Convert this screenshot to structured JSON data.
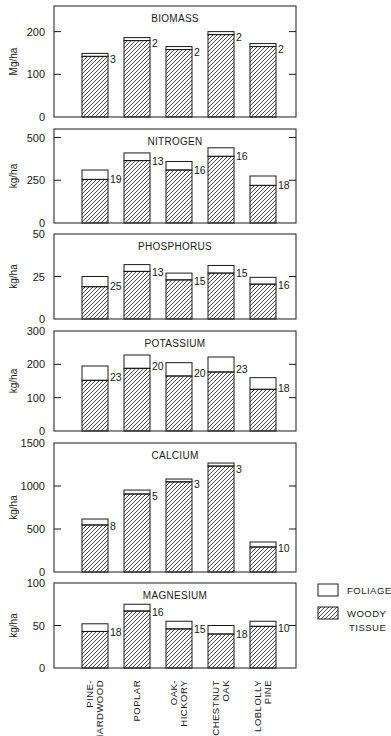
{
  "chart_data": {
    "type": "bar",
    "stacked": true,
    "categories": [
      "PINE-\nHARDWOOD",
      "POPLAR",
      "OAK-\nHICKORY",
      "CHESTNUT\nOAK",
      "LOBLOLLY\nPINE"
    ],
    "legend": {
      "placement": "right",
      "entries": [
        {
          "name": "FOLIAGE",
          "pattern": "open"
        },
        {
          "name": "WOODY\nTISSUE",
          "pattern": "hatched"
        }
      ]
    },
    "panels": [
      {
        "title": "BIOMASS",
        "ylabel": "Mg/ha",
        "ylim": [
          0,
          260
        ],
        "yticks": [
          0,
          100,
          200
        ],
        "grid": false,
        "series": [
          {
            "name": "WOODY TISSUE",
            "values": [
              142,
              179,
              158,
              193,
              165
            ]
          },
          {
            "name": "FOLIAGE",
            "values": [
              7,
              7,
              7,
              7,
              7
            ]
          }
        ],
        "totals": [
          149,
          186,
          165,
          200,
          172
        ],
        "annotations": [
          "3",
          "2",
          "2",
          "2",
          "2"
        ]
      },
      {
        "title": "NITROGEN",
        "ylabel": "kg/ha",
        "ylim": [
          0,
          550
        ],
        "yticks": [
          0,
          250,
          500
        ],
        "grid": false,
        "series": [
          {
            "name": "WOODY TISSUE",
            "values": [
              255,
              365,
              310,
              390,
              220
            ]
          },
          {
            "name": "FOLIAGE",
            "values": [
              55,
              45,
              50,
              50,
              55
            ]
          }
        ],
        "totals": [
          310,
          410,
          360,
          440,
          275
        ],
        "annotations": [
          "19",
          "13",
          "16",
          "16",
          "18"
        ]
      },
      {
        "title": "PHOSPHORUS",
        "ylabel": "kg/ha",
        "ylim": [
          0,
          50
        ],
        "yticks": [
          0,
          25,
          50
        ],
        "grid": false,
        "series": [
          {
            "name": "WOODY TISSUE",
            "values": [
              19,
              28,
              23,
              27,
              20.5
            ]
          },
          {
            "name": "FOLIAGE",
            "values": [
              6,
              4,
              4,
              4.5,
              4
            ]
          }
        ],
        "totals": [
          25,
          32,
          27,
          31.5,
          24.5
        ],
        "annotations": [
          "25",
          "13",
          "15",
          "15",
          "16"
        ]
      },
      {
        "title": "POTASSIUM",
        "ylabel": "kg/ha",
        "ylim": [
          0,
          300
        ],
        "yticks": [
          0,
          100,
          200,
          300
        ],
        "grid": false,
        "series": [
          {
            "name": "WOODY TISSUE",
            "values": [
              152,
              188,
              165,
              177,
              125
            ]
          },
          {
            "name": "FOLIAGE",
            "values": [
              43,
              40,
              40,
              45,
              35
            ]
          }
        ],
        "totals": [
          195,
          228,
          205,
          222,
          160
        ],
        "annotations": [
          "23",
          "20",
          "20",
          "23",
          "18"
        ]
      },
      {
        "title": "CALCIUM",
        "ylabel": "kg/ha",
        "ylim": [
          0,
          1500
        ],
        "yticks": [
          0,
          500,
          1000,
          1500
        ],
        "grid": false,
        "series": [
          {
            "name": "WOODY TISSUE",
            "values": [
              547,
              907,
              1048,
              1232,
              291
            ]
          },
          {
            "name": "FOLIAGE",
            "values": [
              69,
              46,
              33,
              35,
              58
            ]
          }
        ],
        "totals": [
          616,
          953,
          1081,
          1267,
          349
        ],
        "annotations": [
          "8",
          "5",
          "3",
          "3",
          "10"
        ]
      },
      {
        "title": "MAGNESIUM",
        "ylabel": "kg/ha",
        "ylim": [
          0,
          100
        ],
        "yticks": [
          0,
          50,
          100
        ],
        "grid": false,
        "series": [
          {
            "name": "WOODY TISSUE",
            "values": [
              43,
              67,
              46,
              40,
              49
            ]
          },
          {
            "name": "FOLIAGE",
            "values": [
              9,
              8,
              9,
              10,
              6
            ]
          }
        ],
        "totals": [
          52,
          75,
          55,
          50,
          55
        ],
        "annotations": [
          "18",
          "16",
          "15",
          "18",
          "10"
        ]
      }
    ]
  }
}
